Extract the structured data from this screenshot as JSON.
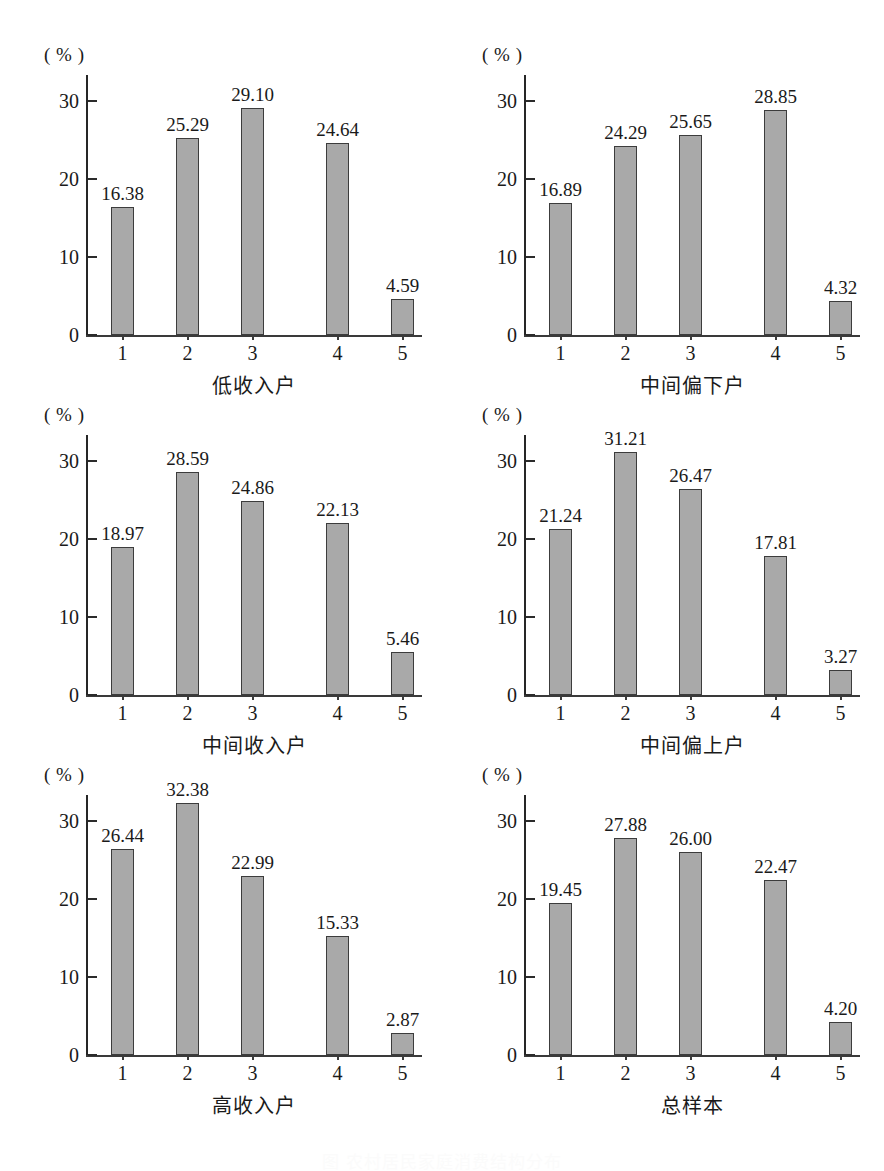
{
  "figure": {
    "unit_label": "( % )",
    "caption": "图    农村居民家庭消费结构分布",
    "axis": {
      "y_ticks": [
        "0",
        "10",
        "20",
        "30"
      ],
      "y_tick_values": [
        0,
        10,
        20,
        30
      ],
      "ylim": [
        0,
        33.1
      ],
      "x_ticks": [
        "1",
        "2",
        "3",
        "4",
        "5"
      ]
    },
    "colors": {
      "bar_fill": "#a9a9a9",
      "bar_border": "#3c3c3c",
      "axis": "#2b2b2b",
      "text": "#1a1a1a"
    }
  },
  "chart_data": [
    {
      "type": "bar",
      "title": "低收入户",
      "xlabel": "低收入户",
      "ylabel": "( % )",
      "categories": [
        "1",
        "2",
        "3",
        "4",
        "5"
      ],
      "values": [
        16.38,
        25.29,
        29.1,
        24.64,
        4.59
      ],
      "labels": [
        "16.38",
        "25.29",
        "29.10",
        "24.64",
        "4.59"
      ],
      "ylim": [
        0,
        33.1
      ],
      "yticks": [
        0,
        10,
        20,
        30
      ],
      "grid": false,
      "legend": "none"
    },
    {
      "type": "bar",
      "title": "中间偏下户",
      "xlabel": "中间偏下户",
      "ylabel": "( % )",
      "categories": [
        "1",
        "2",
        "3",
        "4",
        "5"
      ],
      "values": [
        16.89,
        24.29,
        25.65,
        28.85,
        4.32
      ],
      "labels": [
        "16.89",
        "24.29",
        "25.65",
        "28.85",
        "4.32"
      ],
      "ylim": [
        0,
        33.1
      ],
      "yticks": [
        0,
        10,
        20,
        30
      ],
      "grid": false,
      "legend": "none"
    },
    {
      "type": "bar",
      "title": "中间收入户",
      "xlabel": "中间收入户",
      "ylabel": "( % )",
      "categories": [
        "1",
        "2",
        "3",
        "4",
        "5"
      ],
      "values": [
        18.97,
        28.59,
        24.86,
        22.13,
        5.46
      ],
      "labels": [
        "18.97",
        "28.59",
        "24.86",
        "22.13",
        "5.46"
      ],
      "ylim": [
        0,
        33.1
      ],
      "yticks": [
        0,
        10,
        20,
        30
      ],
      "grid": false,
      "legend": "none"
    },
    {
      "type": "bar",
      "title": "中间偏上户",
      "xlabel": "中间偏上户",
      "ylabel": "( % )",
      "categories": [
        "1",
        "2",
        "3",
        "4",
        "5"
      ],
      "values": [
        21.24,
        31.21,
        26.47,
        17.81,
        3.27
      ],
      "labels": [
        "21.24",
        "31.21",
        "26.47",
        "17.81",
        "3.27"
      ],
      "ylim": [
        0,
        33.1
      ],
      "yticks": [
        0,
        10,
        20,
        30
      ],
      "grid": false,
      "legend": "none"
    },
    {
      "type": "bar",
      "title": "高收入户",
      "xlabel": "高收入户",
      "ylabel": "( % )",
      "categories": [
        "1",
        "2",
        "3",
        "4",
        "5"
      ],
      "values": [
        26.44,
        32.38,
        22.99,
        15.33,
        2.87
      ],
      "labels": [
        "26.44",
        "32.38",
        "22.99",
        "15.33",
        "2.87"
      ],
      "ylim": [
        0,
        33.1
      ],
      "yticks": [
        0,
        10,
        20,
        30
      ],
      "grid": false,
      "legend": "none"
    },
    {
      "type": "bar",
      "title": "总样本",
      "xlabel": "总样本",
      "ylabel": "( % )",
      "categories": [
        "1",
        "2",
        "3",
        "4",
        "5"
      ],
      "values": [
        19.45,
        27.88,
        26.0,
        22.47,
        4.2
      ],
      "labels": [
        "19.45",
        "27.88",
        "26.00",
        "22.47",
        "4.20"
      ],
      "ylim": [
        0,
        33.1
      ],
      "yticks": [
        0,
        10,
        20,
        30
      ],
      "grid": false,
      "legend": "none"
    }
  ]
}
